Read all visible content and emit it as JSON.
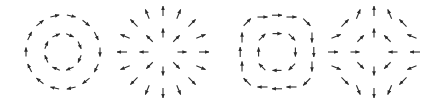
{
  "figure": {
    "width": 440,
    "height": 105,
    "background": "#ffffff",
    "arrow_color": "#2b2b2b",
    "panels": [
      {
        "id": "rotation-circular",
        "description": "clockwise circulation (curl field) on two concentric rings",
        "center": [
          63,
          52
        ],
        "rings": [
          {
            "radius": 37,
            "count": 14,
            "length": 9,
            "offset_deg": 0
          },
          {
            "radius": 18,
            "count": 8,
            "length": 8,
            "offset_deg": 22.5
          }
        ],
        "mode": "clockwise"
      },
      {
        "id": "divergence-source",
        "description": "radial outward field (source)",
        "center": [
          163,
          52
        ],
        "rings": [
          {
            "radius": 41,
            "count": 16,
            "length": 10,
            "offset_deg": 0
          },
          {
            "radius": 19,
            "count": 8,
            "length": 9,
            "offset_deg": 0
          }
        ],
        "mode": "outward"
      },
      {
        "id": "rotation-square",
        "description": "clockwise circulation on square-ish rings",
        "center": [
          277,
          52
        ],
        "rings": [
          {
            "radius": 40,
            "count": 16,
            "length": 10,
            "offset_deg": 0,
            "squareness": 0.35
          },
          {
            "radius": 20,
            "count": 8,
            "length": 9,
            "offset_deg": 0,
            "squareness": 0.35
          }
        ],
        "mode": "clockwise"
      },
      {
        "id": "saddle",
        "description": "saddle field: outward vertically, inward horizontally",
        "center": [
          374,
          52
        ],
        "rings": [
          {
            "radius": 41,
            "count": 16,
            "length": 10,
            "offset_deg": 0
          },
          {
            "radius": 19,
            "count": 8,
            "length": 9,
            "offset_deg": 0
          }
        ],
        "mode": "saddle"
      }
    ]
  }
}
